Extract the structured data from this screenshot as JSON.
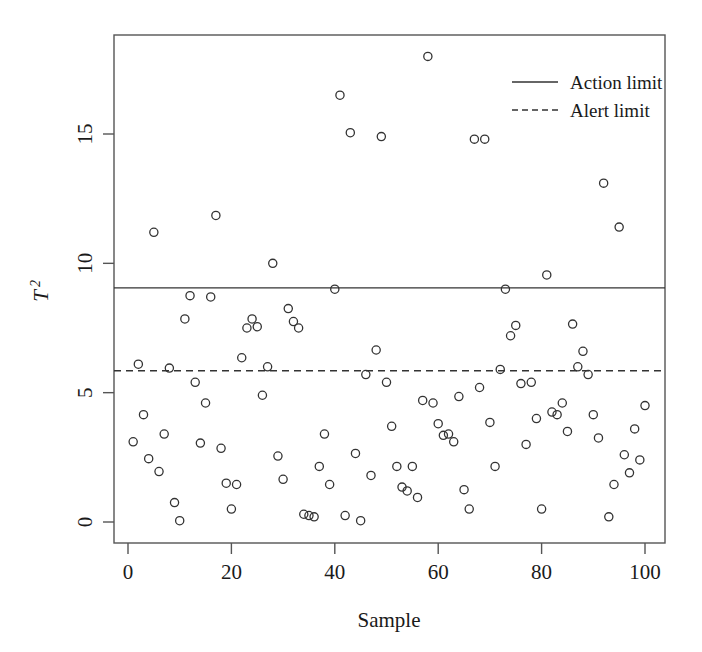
{
  "chart_data": {
    "type": "scatter",
    "title": "",
    "xlabel": "Sample",
    "ylabel": "T²",
    "ylabel_base": "T",
    "ylabel_exponent": "2",
    "xlim": [
      -2,
      103
    ],
    "ylim": [
      -1.0,
      18.8
    ],
    "xticks": [
      0,
      20,
      40,
      60,
      80,
      100
    ],
    "xtick_labels": [
      "0",
      "20",
      "40",
      "60",
      "80",
      "100"
    ],
    "yticks": [
      0,
      5,
      10,
      15
    ],
    "ytick_labels": [
      "0",
      "5",
      "10",
      "15"
    ],
    "grid": false,
    "marker": "open-circle",
    "marker_color": "#333333",
    "background_color": "#ffffff",
    "frame_color": "#555555",
    "legend": {
      "position": "top-right",
      "entries": [
        {
          "label": "Action limit",
          "style": "solid",
          "color": "#333333"
        },
        {
          "label": "Alert limit",
          "style": "dashed",
          "color": "#333333"
        }
      ]
    },
    "reference_lines": [
      {
        "name": "action-limit",
        "value": 9.05,
        "style": "solid",
        "color": "#333333"
      },
      {
        "name": "alert-limit",
        "value": 5.85,
        "style": "dashed",
        "color": "#333333"
      }
    ],
    "x": [
      1,
      2,
      3,
      4,
      5,
      6,
      7,
      8,
      9,
      10,
      11,
      12,
      13,
      14,
      15,
      16,
      17,
      18,
      19,
      20,
      21,
      22,
      23,
      24,
      25,
      26,
      27,
      28,
      29,
      30,
      31,
      32,
      33,
      34,
      35,
      36,
      37,
      38,
      39,
      40,
      41,
      42,
      43,
      44,
      45,
      46,
      47,
      48,
      49,
      50,
      51,
      52,
      53,
      54,
      55,
      56,
      57,
      58,
      59,
      60,
      61,
      62,
      63,
      64,
      65,
      66,
      67,
      68,
      69,
      70,
      71,
      72,
      73,
      74,
      75,
      76,
      77,
      78,
      79,
      80,
      81,
      82,
      83,
      84,
      85,
      86,
      87,
      88,
      89,
      90,
      91,
      92,
      93,
      94,
      95,
      96,
      97,
      98,
      99,
      100
    ],
    "y": [
      3.1,
      6.1,
      4.15,
      2.45,
      11.2,
      1.95,
      3.4,
      5.95,
      0.75,
      0.05,
      7.85,
      8.75,
      5.4,
      3.05,
      4.6,
      8.7,
      11.85,
      2.85,
      1.5,
      0.5,
      1.45,
      6.35,
      7.5,
      7.85,
      7.55,
      4.9,
      6.0,
      10.0,
      2.55,
      1.65,
      8.25,
      7.75,
      7.5,
      0.3,
      0.25,
      0.2,
      2.15,
      3.4,
      1.45,
      9.0,
      16.5,
      0.25,
      15.05,
      2.65,
      0.05,
      5.7,
      1.8,
      6.65,
      14.9,
      5.4,
      3.7,
      2.15,
      1.35,
      1.2,
      2.15,
      0.95,
      4.7,
      18.0,
      4.6,
      3.8,
      3.35,
      3.4,
      3.1,
      4.85,
      1.25,
      0.5,
      14.8,
      5.2,
      14.8,
      3.85,
      2.15,
      5.9,
      9.0,
      7.2,
      7.6,
      5.35,
      3.0,
      5.4,
      4.0,
      0.5,
      9.55,
      4.25,
      4.15,
      4.6,
      3.5,
      7.65,
      6.0,
      6.6,
      5.7,
      4.15,
      3.25,
      13.1,
      0.2,
      1.45,
      11.4,
      2.6,
      1.9,
      3.6,
      2.4,
      4.5
    ],
    "n_points": 100,
    "points_above_action_limit": 13,
    "points_above_alert_limit": 28
  }
}
